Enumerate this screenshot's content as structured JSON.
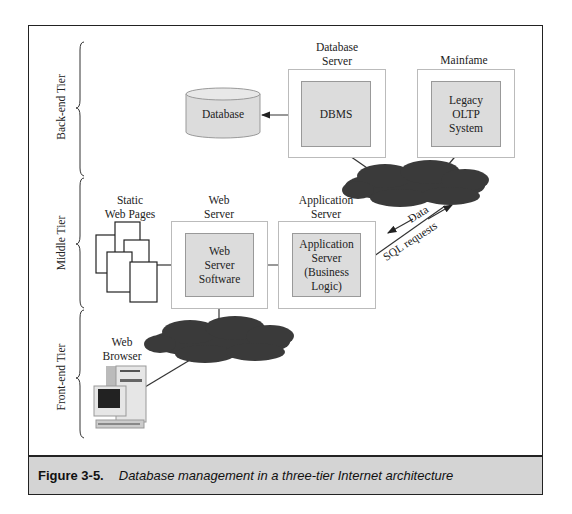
{
  "tiers": {
    "back_end": "Back-end Tier",
    "middle": "Middle Tier",
    "front_end": "Front-end Tier"
  },
  "nodes": {
    "database": {
      "label": "Database"
    },
    "database_server": {
      "title": "Database\nServer",
      "inner": "DBMS"
    },
    "mainframe": {
      "title": "Mainfame",
      "inner": "Legacy\nOLTP\nSystem"
    },
    "static_pages": {
      "title": "Static\nWeb Pages"
    },
    "web_server": {
      "title": "Web\nServer",
      "inner": "Web\nServer\nSoftware"
    },
    "app_server": {
      "title": "Application\nServer",
      "inner": "Application\nServer\n(Business\nLogic)"
    },
    "web_browser": {
      "title": "Web\nBrowser"
    }
  },
  "edges": {
    "data_label": "Data",
    "sql_label": "SQL requests"
  },
  "caption": {
    "number": "Figure 3-5.",
    "text": "Database management in a three-tier Internet architecture"
  },
  "colors": {
    "cloud": "#3a3a3a",
    "box_fill": "#dcdcdc",
    "caption_bg": "#d4d4d4"
  }
}
